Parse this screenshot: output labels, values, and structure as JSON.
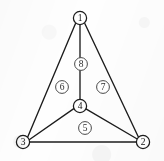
{
  "figure": {
    "width": 164,
    "height": 161,
    "background_color": "#fefefe",
    "line_color": "#1c1c1c",
    "face_label_color": "#2b2b2b"
  },
  "vertices": [
    {
      "id": "v1",
      "label": "1",
      "x": 80,
      "y": 18,
      "r": 6.6
    },
    {
      "id": "v2",
      "label": "2",
      "x": 143,
      "y": 142,
      "r": 6.6
    },
    {
      "id": "v3",
      "label": "3",
      "x": 23,
      "y": 142,
      "r": 6.6
    },
    {
      "id": "v4",
      "label": "4",
      "x": 80,
      "y": 106,
      "r": 6.6
    }
  ],
  "edges": [
    {
      "id": "e13",
      "from": "v1",
      "to": "v3",
      "x1": 75.5,
      "y1": 23.5,
      "x2": 27.5,
      "y2": 137.5
    },
    {
      "id": "e12",
      "from": "v1",
      "to": "v2",
      "x1": 84.8,
      "y1": 23.5,
      "x2": 138.5,
      "y2": 137.2
    },
    {
      "id": "e14",
      "from": "v1",
      "to": "v4",
      "x1": 80,
      "y1": 24.6,
      "x2": 80,
      "y2": 99.4
    },
    {
      "id": "e34",
      "from": "v3",
      "to": "v4",
      "x1": 29.2,
      "y1": 139.8,
      "x2": 73.8,
      "y2": 108.6
    },
    {
      "id": "e42",
      "from": "v4",
      "to": "v2",
      "x1": 85.9,
      "y1": 108.9,
      "x2": 137.2,
      "y2": 139.0
    },
    {
      "id": "e32",
      "from": "v3",
      "to": "v2",
      "x1": 29.6,
      "y1": 142,
      "x2": 136.4,
      "y2": 142
    }
  ],
  "faces": [
    {
      "id": "f5",
      "label": "5",
      "x": 85,
      "y": 128,
      "r": 6.4,
      "region": "bottom-region-3-4-2"
    },
    {
      "id": "f6",
      "label": "6",
      "x": 62,
      "y": 87,
      "r": 6.4,
      "region": "left-region-1-3-4"
    },
    {
      "id": "f7",
      "label": "7",
      "x": 103,
      "y": 87,
      "r": 6.4,
      "region": "right-region-1-4-2"
    },
    {
      "id": "f8",
      "label": "8",
      "x": 81,
      "y": 64,
      "r": 6.4,
      "region": "edge-label-1-4"
    }
  ]
}
